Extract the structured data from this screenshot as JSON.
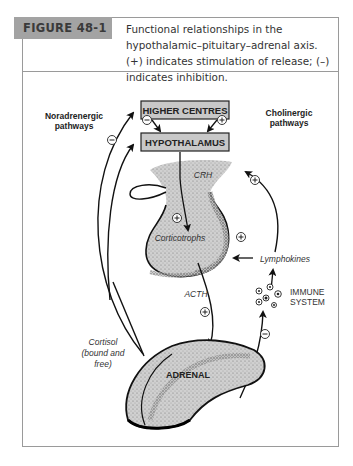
{
  "figure": {
    "label": "FIGURE 48-1",
    "caption": "Functional relationships in the hypothalamic–pituitary–adrenal axis. (+) indicates stimulation of release; (–) indicates inhibition."
  },
  "diagram": {
    "boxes": {
      "higher_centres": "HIGHER CENTRES",
      "hypothalamus": "HYPOTHALAMUS"
    },
    "side_labels": {
      "noradrenergic_line1": "Noradrenergic",
      "noradrenergic_line2": "pathways",
      "cholinergic_line1": "Cholinergic",
      "cholinergic_line2": "pathways"
    },
    "labels": {
      "crh": "CRH",
      "corticotrophs": "Corticotrophs",
      "lymphokines": "Lymphokines",
      "acth": "ACTH",
      "immune_line1": "IMMUNE",
      "immune_line2": "SYSTEM",
      "cortisol_line1": "Cortisol",
      "cortisol_line2": "(bound and",
      "cortisol_line3": "free)",
      "adrenal": "ADRENAL"
    },
    "signs": {
      "plus": "+",
      "minus": "–"
    },
    "colors": {
      "box_fill": "#c8c8c8",
      "gland_fill": "#d2d2d2",
      "header_label_bg": "#a3a3a3",
      "border": "#9a9a9a"
    }
  }
}
